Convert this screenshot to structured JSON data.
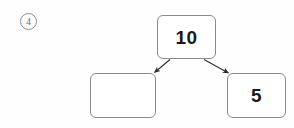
{
  "item": {
    "number_label": "4",
    "marker_shape": "circle"
  },
  "diagram": {
    "kind": "number-bond-decomposition",
    "total": {
      "value": "10",
      "empty": false
    },
    "parts": [
      {
        "position": "left",
        "value": "",
        "empty": true
      },
      {
        "position": "right",
        "value": "5",
        "empty": false
      }
    ],
    "arrows": [
      {
        "name": "arrow-total-to-left-part",
        "from": "total-box-bottom-left",
        "to": "left-part-box-top-right",
        "direction": "down-left"
      },
      {
        "name": "arrow-total-to-right-part",
        "from": "total-box-bottom-right",
        "to": "right-part-box-top-left",
        "direction": "down-right"
      }
    ]
  },
  "colors": {
    "page_background": "#fefefe",
    "box_background": "#ffffff",
    "box_border": "#8a8a8a",
    "text": "#1a1a1a",
    "marker_border": "#8d8d8d",
    "marker_text": "#6f6f6f",
    "arrow": "#2b2b2b"
  }
}
